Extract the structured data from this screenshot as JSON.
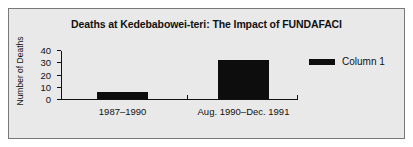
{
  "chart_data": {
    "type": "bar",
    "title": "Deaths at Kedebabowei-teri: The Impact of FUNDAFACI",
    "xlabel": "",
    "ylabel": "Number of Deaths",
    "categories": [
      "1987–1990",
      "Aug. 1990–Dec. 1991"
    ],
    "values": [
      6,
      32
    ],
    "series": [
      {
        "name": "Column 1",
        "values": [
          6,
          32
        ]
      }
    ],
    "ylim": [
      0,
      40
    ],
    "yticks": [
      0,
      10,
      20,
      30,
      40
    ],
    "ytick_labels": [
      "0",
      "10",
      "20",
      "30",
      "40"
    ],
    "grid": false,
    "legend": {
      "position": "right",
      "entries": [
        {
          "label": "Column 1",
          "color": "#0d0d0d"
        }
      ]
    },
    "colors": {
      "bar": "#0d0d0d",
      "axis": "#111111",
      "text": "#111111",
      "background": "#e9e9e9",
      "border": "#77787a",
      "page": "#ffffff"
    }
  }
}
